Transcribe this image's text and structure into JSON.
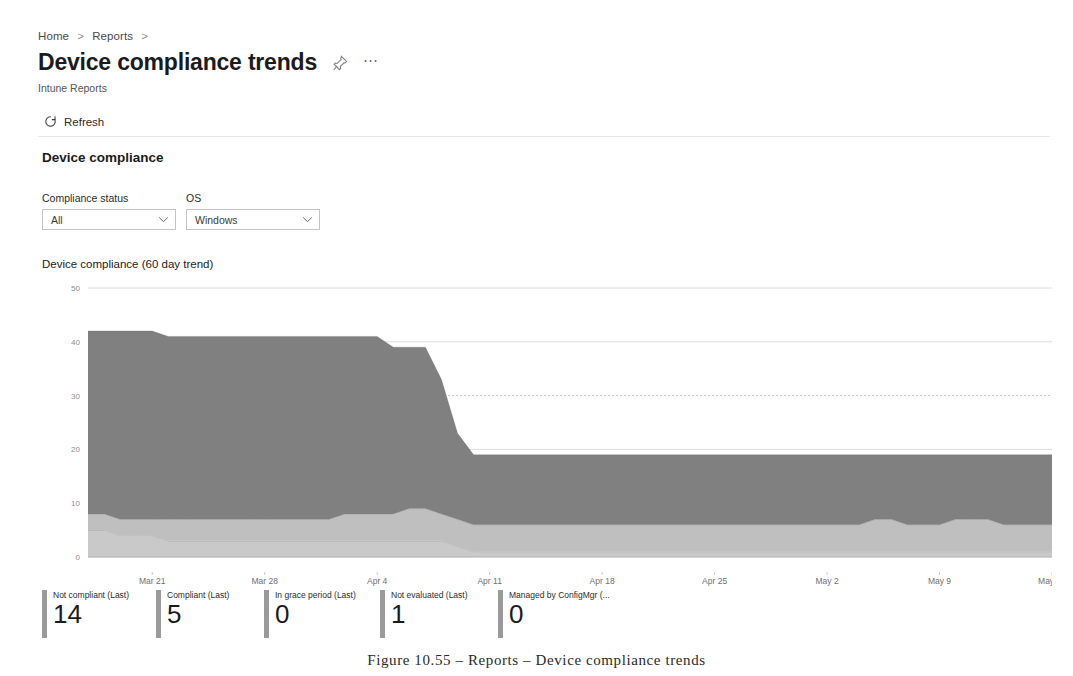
{
  "breadcrumb": {
    "items": [
      "Home",
      "Reports"
    ],
    "separator": ">"
  },
  "header": {
    "title": "Device compliance trends",
    "subtitle": "Intune Reports",
    "pin_icon": "pin-icon",
    "more_icon": "ellipsis-icon"
  },
  "commandbar": {
    "refresh_label": "Refresh",
    "refresh_icon": "refresh-icon"
  },
  "section": {
    "title": "Device compliance"
  },
  "filters": [
    {
      "label": "Compliance status",
      "value": "All",
      "icon": "chevron-down-icon"
    },
    {
      "label": "OS",
      "value": "Windows",
      "icon": "chevron-down-icon"
    }
  ],
  "chart_data": {
    "type": "area",
    "title": "Device compliance (60 day trend)",
    "stacked": true,
    "xlabel": "",
    "ylabel": "",
    "ylim": [
      0,
      50
    ],
    "yticks": [
      0,
      10,
      20,
      30,
      40,
      50
    ],
    "grid": true,
    "legend_position": "bottom",
    "xticks": [
      "Mar 21",
      "Mar 28",
      "Apr 4",
      "Apr 11",
      "Apr 18",
      "Apr 25",
      "May 2",
      "May 9",
      "May 16"
    ],
    "x": [
      "Mar 17",
      "Mar 18",
      "Mar 19",
      "Mar 20",
      "Mar 21",
      "Mar 22",
      "Mar 23",
      "Mar 24",
      "Mar 25",
      "Mar 26",
      "Mar 27",
      "Mar 28",
      "Mar 29",
      "Mar 30",
      "Mar 31",
      "Apr 1",
      "Apr 2",
      "Apr 3",
      "Apr 4",
      "Apr 5",
      "Apr 6",
      "Apr 7",
      "Apr 8",
      "Apr 9",
      "Apr 10",
      "Apr 11",
      "Apr 12",
      "Apr 13",
      "Apr 14",
      "Apr 15",
      "Apr 16",
      "Apr 17",
      "Apr 18",
      "Apr 19",
      "Apr 20",
      "Apr 21",
      "Apr 22",
      "Apr 23",
      "Apr 24",
      "Apr 25",
      "Apr 26",
      "Apr 27",
      "Apr 28",
      "Apr 29",
      "Apr 30",
      "May 1",
      "May 2",
      "May 3",
      "May 4",
      "May 5",
      "May 6",
      "May 7",
      "May 8",
      "May 9",
      "May 10",
      "May 11",
      "May 12",
      "May 13",
      "May 14",
      "May 15",
      "May 16"
    ],
    "series": [
      {
        "name": "Not evaluated",
        "color": "#c9c9c9",
        "values": [
          5,
          5,
          4,
          4,
          4,
          3,
          3,
          3,
          3,
          3,
          3,
          3,
          3,
          3,
          3,
          3,
          3,
          3,
          3,
          3,
          3,
          3,
          3,
          2,
          1,
          1,
          1,
          1,
          1,
          1,
          1,
          1,
          1,
          1,
          1,
          1,
          1,
          1,
          1,
          1,
          1,
          1,
          1,
          1,
          1,
          1,
          1,
          1,
          1,
          1,
          1,
          1,
          1,
          1,
          1,
          1,
          1,
          1,
          1,
          1,
          1
        ]
      },
      {
        "name": "Compliant",
        "color": "#bfbfbf",
        "values": [
          3,
          3,
          3,
          3,
          3,
          4,
          4,
          4,
          4,
          4,
          4,
          4,
          4,
          4,
          4,
          4,
          5,
          5,
          5,
          5,
          6,
          6,
          5,
          5,
          5,
          5,
          5,
          5,
          5,
          5,
          5,
          5,
          5,
          5,
          5,
          5,
          5,
          5,
          5,
          5,
          5,
          5,
          5,
          5,
          5,
          5,
          5,
          5,
          5,
          6,
          6,
          5,
          5,
          5,
          6,
          6,
          6,
          5,
          5,
          5,
          5
        ]
      },
      {
        "name": "Not compliant",
        "color": "#808080",
        "values": [
          34,
          34,
          35,
          35,
          35,
          34,
          34,
          34,
          34,
          34,
          34,
          34,
          34,
          34,
          34,
          34,
          33,
          33,
          33,
          31,
          30,
          30,
          25,
          16,
          13,
          13,
          13,
          13,
          13,
          13,
          13,
          13,
          13,
          13,
          13,
          13,
          13,
          13,
          13,
          13,
          13,
          13,
          13,
          13,
          13,
          13,
          13,
          13,
          13,
          12,
          12,
          13,
          13,
          13,
          12,
          12,
          12,
          13,
          13,
          13,
          13
        ]
      }
    ],
    "totals_note": "stacked totals start near 42 and drop to about 19 after Apr 9"
  },
  "kpis": [
    {
      "label": "Not compliant (Last)",
      "value": "14",
      "color": "#9a9a9a"
    },
    {
      "label": "Compliant (Last)",
      "value": "5",
      "color": "#9a9a9a"
    },
    {
      "label": "In grace period (Last)",
      "value": "0",
      "color": "#9a9a9a"
    },
    {
      "label": "Not evaluated (Last)",
      "value": "1",
      "color": "#9a9a9a"
    },
    {
      "label": "Managed by ConfigMgr (...",
      "value": "0",
      "color": "#9a9a9a"
    }
  ],
  "caption": "Figure 10.55 – Reports – Device compliance trends"
}
